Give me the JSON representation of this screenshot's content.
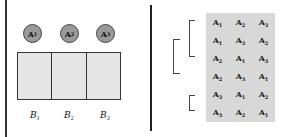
{
  "left_panel": {
    "objects": [
      {
        "letter": "A",
        "sub": "1"
      },
      {
        "letter": "A",
        "sub": "2"
      },
      {
        "letter": "A",
        "sub": "3"
      }
    ],
    "boxes": [
      {
        "letter": "B",
        "sub": "1"
      },
      {
        "letter": "B",
        "sub": "2"
      },
      {
        "letter": "B",
        "sub": "3"
      }
    ]
  },
  "right_panel": {
    "permutations": [
      [
        {
          "letter": "A",
          "sub": "1"
        },
        {
          "letter": "A",
          "sub": "2"
        },
        {
          "letter": "A",
          "sub": "3"
        }
      ],
      [
        {
          "letter": "A",
          "sub": "1"
        },
        {
          "letter": "A",
          "sub": "3"
        },
        {
          "letter": "A",
          "sub": "2"
        }
      ],
      [
        {
          "letter": "A",
          "sub": "2"
        },
        {
          "letter": "A",
          "sub": "1"
        },
        {
          "letter": "A",
          "sub": "3"
        }
      ],
      [
        {
          "letter": "A",
          "sub": "2"
        },
        {
          "letter": "A",
          "sub": "3"
        },
        {
          "letter": "A",
          "sub": "1"
        }
      ],
      [
        {
          "letter": "A",
          "sub": "3"
        },
        {
          "letter": "A",
          "sub": "1"
        },
        {
          "letter": "A",
          "sub": "2"
        }
      ],
      [
        {
          "letter": "A",
          "sub": "3"
        },
        {
          "letter": "A",
          "sub": "2"
        },
        {
          "letter": "A",
          "sub": "1"
        }
      ]
    ],
    "background_color": "#d8d8d8"
  }
}
